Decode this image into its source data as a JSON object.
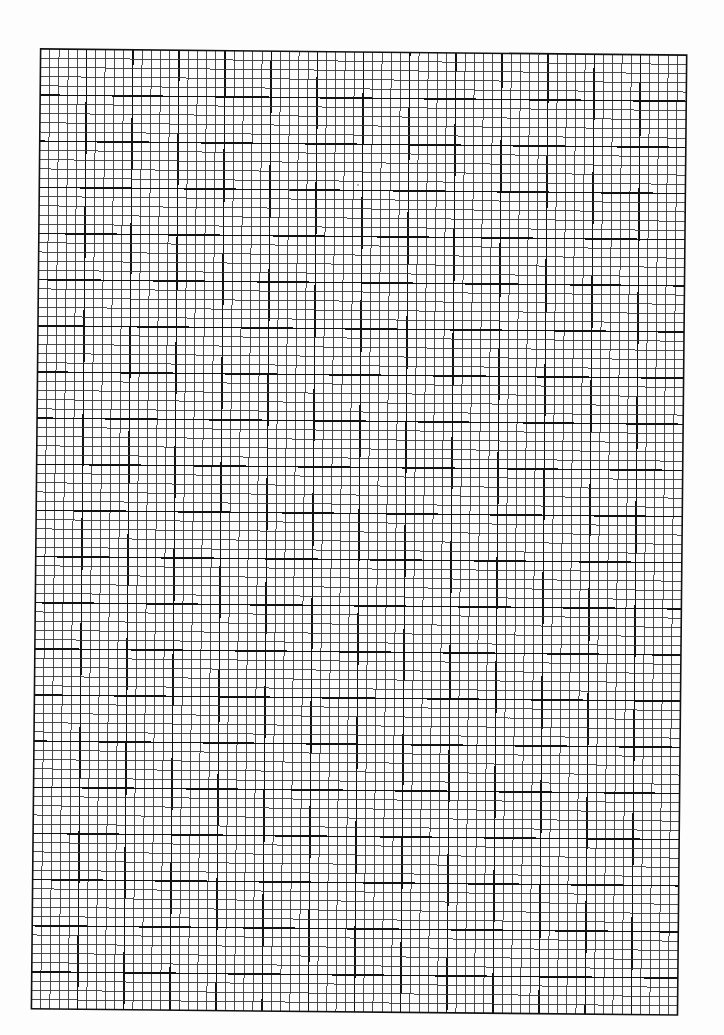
{
  "page": {
    "width": 724,
    "height": 1035,
    "background": "#fdfdfd"
  },
  "graph_paper": {
    "origin_x": 36,
    "origin_y": 52,
    "columns": 70,
    "rows": 104,
    "cell_size": 9.23,
    "major_every": 5,
    "rotation_deg": 0.55,
    "minor_line_color": "#3a3a3a",
    "major_line_color": "#111111",
    "border_color": "#111111",
    "minor_line_width": 0.9,
    "major_line_width": 1.5,
    "border_width": 1.6
  },
  "specks": [
    {
      "x": 289,
      "y": 190,
      "r": 1.2
    },
    {
      "x": 358,
      "y": 185,
      "r": 0.8
    }
  ]
}
